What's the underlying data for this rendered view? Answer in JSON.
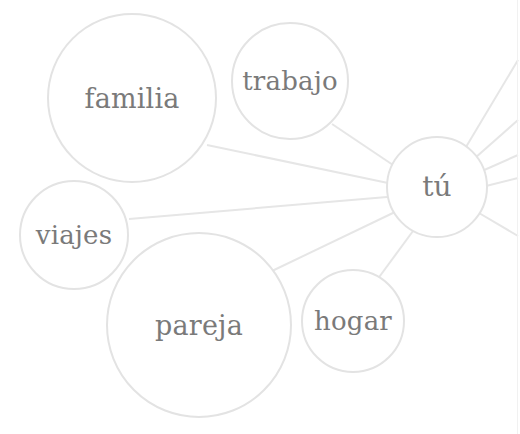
{
  "diagram": {
    "type": "mind-map",
    "colors": {
      "background": "#ffffff",
      "circle_stroke": "#e3e3e3",
      "edge_stroke": "#e6e6e6",
      "label": "#7a7a7a"
    },
    "center": {
      "id": "tu",
      "label": "tú",
      "cx": 437,
      "cy": 187,
      "r": 50,
      "font_size": 28
    },
    "nodes": [
      {
        "id": "familia",
        "label": "familia",
        "cx": 132,
        "cy": 98,
        "r": 84,
        "font_size": 27
      },
      {
        "id": "trabajo",
        "label": "trabajo",
        "cx": 290,
        "cy": 81,
        "r": 58,
        "font_size": 26
      },
      {
        "id": "viajes",
        "label": "viajes",
        "cx": 74,
        "cy": 235,
        "r": 54,
        "font_size": 26
      },
      {
        "id": "pareja",
        "label": "pareja",
        "cx": 199,
        "cy": 325,
        "r": 92,
        "font_size": 27
      },
      {
        "id": "hogar",
        "label": "hogar",
        "cx": 353,
        "cy": 321,
        "r": 51,
        "font_size": 26
      }
    ],
    "edges": [
      {
        "from": "tu",
        "to": "trabajo",
        "x1": 393,
        "y1": 165,
        "x2": 332,
        "y2": 124
      },
      {
        "from": "tu",
        "to": "familia",
        "x1": 388,
        "y1": 183,
        "x2": 207,
        "y2": 145
      },
      {
        "from": "tu",
        "to": "viajes",
        "x1": 387,
        "y1": 197,
        "x2": 129,
        "y2": 219
      },
      {
        "from": "tu",
        "to": "pareja",
        "x1": 395,
        "y1": 212,
        "x2": 272,
        "y2": 271
      },
      {
        "from": "tu",
        "to": "hogar",
        "x1": 413,
        "y1": 231,
        "x2": 377,
        "y2": 280
      },
      {
        "from": "tu",
        "to": "offscreen-1",
        "x1": 466,
        "y1": 147,
        "x2": 518,
        "y2": 60
      },
      {
        "from": "tu",
        "to": "offscreen-2",
        "x1": 475,
        "y1": 158,
        "x2": 518,
        "y2": 120
      },
      {
        "from": "tu",
        "to": "offscreen-3",
        "x1": 482,
        "y1": 171,
        "x2": 518,
        "y2": 155
      },
      {
        "from": "tu",
        "to": "offscreen-4",
        "x1": 486,
        "y1": 186,
        "x2": 518,
        "y2": 178
      },
      {
        "from": "tu",
        "to": "offscreen-5",
        "x1": 479,
        "y1": 213,
        "x2": 518,
        "y2": 236
      }
    ],
    "partial_top_arc": {
      "cx": 165,
      "cy": 120,
      "r": 100
    }
  }
}
